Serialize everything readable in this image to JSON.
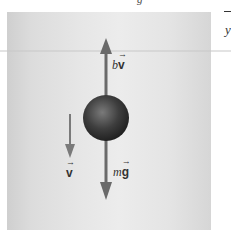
{
  "figure": {
    "labels": {
      "drag_force": "bv⃗",
      "drag_force_coef": "b",
      "drag_force_vec": "v",
      "weight": "mg⃗",
      "weight_m": "m",
      "weight_vec": "g",
      "velocity": "v"
    },
    "clipped_text": {
      "top": "g",
      "right_axis": "y"
    },
    "colors": {
      "arrow": "#6a6a6a",
      "sphere_dark": "#2a2a2a",
      "sphere_light": "#7a7a7a",
      "panel": "#e2e2e2"
    }
  }
}
